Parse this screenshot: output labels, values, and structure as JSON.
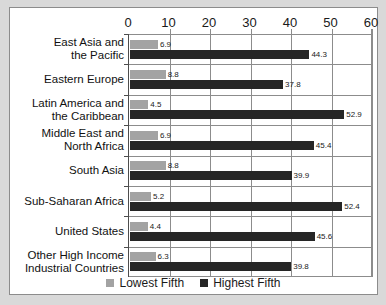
{
  "chart_data": {
    "type": "bar",
    "orientation": "horizontal",
    "title": "",
    "xlabel": "",
    "ylabel": "",
    "xlim": [
      0,
      60
    ],
    "xticks": [
      0,
      10,
      20,
      30,
      40,
      50,
      60
    ],
    "grid": true,
    "legend_position": "bottom",
    "categories": [
      "East Asia and\nthe Pacific",
      "Eastern Europe",
      "Latin America and\nthe Caribbean",
      "Middle East and\nNorth Africa",
      "South Asia",
      "Sub-Saharan Africa",
      "United States",
      "Other High Income\nIndustrial Countries"
    ],
    "series": [
      {
        "name": "Lowest Fifth",
        "color": "#a3a3a3",
        "values": [
          6.9,
          8.8,
          4.5,
          6.9,
          8.8,
          5.2,
          4.4,
          6.3
        ]
      },
      {
        "name": "Highest Fifth",
        "color": "#262626",
        "values": [
          44.3,
          37.8,
          52.9,
          45.4,
          39.9,
          52.4,
          45.6,
          39.8
        ]
      }
    ]
  },
  "legend": {
    "items": [
      {
        "label": "Lowest Fifth",
        "swatch": "low"
      },
      {
        "label": "Highest Fifth",
        "swatch": "high"
      }
    ]
  }
}
